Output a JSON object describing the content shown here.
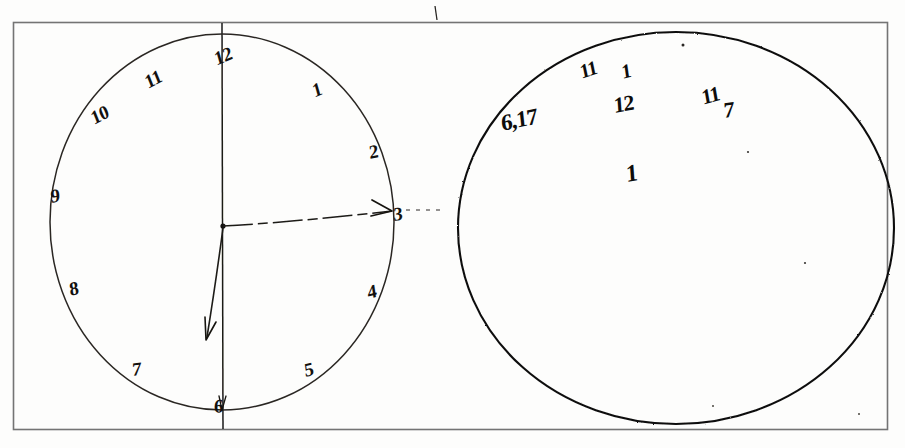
{
  "document": {
    "kind": "clock-drawing-test-scan",
    "frame": {
      "stroke": "#6f6f6f",
      "x": 13,
      "y": 22,
      "width": 875,
      "height": 408
    },
    "ink_color": "#13110f",
    "paper_color": "#fdfdfc"
  },
  "left_clock": {
    "label": "clock face with numerals and hands",
    "circle": {
      "cx": 222,
      "cy": 222,
      "rx": 172,
      "ry": 188,
      "stroke": "#2a2724"
    },
    "numerals": [
      {
        "text": "12",
        "x": 212,
        "y": 50,
        "rot": -22
      },
      {
        "text": "1",
        "x": 310,
        "y": 82,
        "rot": -22
      },
      {
        "text": "2",
        "x": 368,
        "y": 143,
        "rot": -12
      },
      {
        "text": "3",
        "x": 393,
        "y": 205,
        "rot": -8
      },
      {
        "text": "4",
        "x": 366,
        "y": 283,
        "rot": -14
      },
      {
        "text": "5",
        "x": 303,
        "y": 361,
        "rot": -14
      },
      {
        "text": "6",
        "x": 214,
        "y": 397,
        "rot": -6
      },
      {
        "text": "7",
        "x": 132,
        "y": 360,
        "rot": -6
      },
      {
        "text": "8",
        "x": 68,
        "y": 280,
        "rot": -14
      },
      {
        "text": "9",
        "x": 50,
        "y": 187,
        "rot": -10
      },
      {
        "text": "10",
        "x": 88,
        "y": 110,
        "rot": -28
      },
      {
        "text": "11",
        "x": 142,
        "y": 74,
        "rot": -28
      }
    ],
    "center_dot": {
      "x": 223,
      "y": 226
    },
    "hands": [
      {
        "name": "hand-to-3-horizontal-arrow",
        "from": [
          223,
          226
        ],
        "to": [
          392,
          211
        ]
      },
      {
        "name": "hand-to-bottom-left-arrow",
        "from": [
          223,
          226
        ],
        "to": [
          206,
          339
        ]
      }
    ],
    "axis_vertical": {
      "x": 222,
      "y1": 23,
      "y2": 429,
      "style": "solid"
    },
    "axis_horizontal": {
      "y": 209,
      "x1": 14,
      "x2": 440,
      "style": "dash-dot"
    }
  },
  "right_circle": {
    "label": "second circle with scattered perseverative numerals",
    "circle": {
      "cx": 676,
      "cy": 228,
      "rx": 218,
      "ry": 196,
      "stroke": "#111010"
    },
    "marks": [
      {
        "text": "6,17",
        "x": 500,
        "y": 112,
        "rot": -12,
        "size": 23
      },
      {
        "text": "11",
        "x": 578,
        "y": 62,
        "rot": -18,
        "size": 20
      },
      {
        "text": "1",
        "x": 620,
        "y": 62,
        "rot": -14,
        "size": 20
      },
      {
        "text": "12",
        "x": 613,
        "y": 95,
        "rot": -10,
        "size": 22
      },
      {
        "text": "11",
        "x": 700,
        "y": 88,
        "rot": -16,
        "size": 21
      },
      {
        "text": "7",
        "x": 723,
        "y": 100,
        "rot": -8,
        "size": 22
      },
      {
        "text": "1",
        "x": 625,
        "y": 162,
        "rot": -10,
        "size": 24
      }
    ]
  },
  "stray_marks": [
    {
      "name": "tick-above-frame",
      "x": 435,
      "y": 12,
      "length": 14
    },
    {
      "name": "speck-upper-right-circle",
      "x": 683,
      "y": 45
    },
    {
      "name": "speck-right-mid",
      "x": 748,
      "y": 152
    },
    {
      "name": "speck-lower-right",
      "x": 805,
      "y": 263
    },
    {
      "name": "speck-bottom-right",
      "x": 713,
      "y": 406
    },
    {
      "name": "speck-far-bottom-right",
      "x": 859,
      "y": 414
    }
  ]
}
